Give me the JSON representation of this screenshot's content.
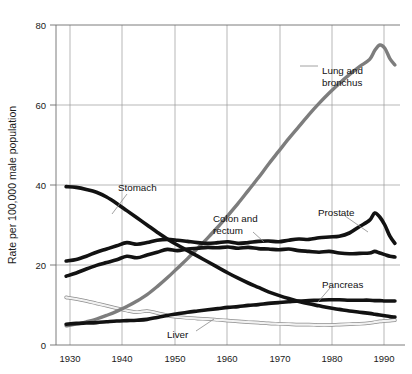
{
  "chart_data": {
    "type": "line",
    "title": "",
    "xlabel": "",
    "ylabel": "Rate per 100,000 male population",
    "xlim": [
      1928,
      1996
    ],
    "ylim": [
      0,
      80
    ],
    "xticks": [
      "1930",
      "1940",
      "1950",
      "1960",
      "1970",
      "1980",
      "1990"
    ],
    "xtick_values": [
      1930,
      1940,
      1950,
      1960,
      1970,
      1980,
      1990
    ],
    "yticks": [
      "0",
      "20",
      "40",
      "60",
      "80"
    ],
    "ytick_values": [
      0,
      20,
      40,
      60,
      80
    ],
    "grid": true,
    "legend_position": "inline-annotations",
    "x": [
      1930,
      1932,
      1934,
      1936,
      1938,
      1940,
      1942,
      1944,
      1946,
      1948,
      1950,
      1952,
      1954,
      1956,
      1958,
      1960,
      1962,
      1964,
      1966,
      1968,
      1970,
      1972,
      1974,
      1976,
      1978,
      1980,
      1982,
      1984,
      1986,
      1988,
      1990,
      1991,
      1992,
      1993,
      1994,
      1995
    ],
    "series": [
      {
        "name": "Lung and bronchus",
        "color": "#7d7d7d",
        "label": "Lung and bronchus",
        "values": [
          4.8,
          5.2,
          5.8,
          6.5,
          7.4,
          8.4,
          9.6,
          11.0,
          12.6,
          14.6,
          16.8,
          19.2,
          21.6,
          24.2,
          26.8,
          29.5,
          32.4,
          35.4,
          38.6,
          41.8,
          45.2,
          48.4,
          51.6,
          54.6,
          57.6,
          60.4,
          63.0,
          65.4,
          67.6,
          69.6,
          71.4,
          73.6,
          75.0,
          74.2,
          71.6,
          70.0
        ]
      },
      {
        "name": "Stomach",
        "color": "#121212",
        "label": "Stomach",
        "values": [
          39.6,
          39.4,
          38.9,
          38.2,
          37.0,
          35.4,
          33.6,
          31.8,
          30.0,
          28.2,
          26.5,
          25.0,
          23.6,
          22.2,
          20.8,
          19.4,
          18.0,
          16.7,
          15.5,
          14.4,
          13.3,
          12.4,
          11.6,
          10.9,
          10.3,
          9.8,
          9.3,
          8.9,
          8.5,
          8.2,
          7.9,
          7.7,
          7.5,
          7.3,
          7.1,
          7.0
        ]
      },
      {
        "name": "Prostate",
        "color": "#121212",
        "label": "Prostate",
        "values": [
          21.0,
          21.4,
          22.2,
          23.2,
          24.0,
          24.8,
          25.6,
          25.2,
          25.6,
          26.2,
          26.4,
          26.2,
          25.9,
          25.6,
          25.4,
          25.6,
          25.8,
          25.4,
          25.6,
          25.9,
          26.0,
          25.8,
          26.2,
          26.5,
          26.4,
          26.8,
          27.0,
          27.2,
          28.0,
          29.6,
          31.2,
          33.0,
          32.0,
          30.0,
          27.2,
          25.4
        ]
      },
      {
        "name": "Colon and rectum",
        "color": "#121212",
        "label": "Colon and rectum",
        "values": [
          17.2,
          18.0,
          19.0,
          19.9,
          20.6,
          21.3,
          22.2,
          21.8,
          22.5,
          23.2,
          23.9,
          23.6,
          24.0,
          24.2,
          24.4,
          24.3,
          24.5,
          24.2,
          24.4,
          24.1,
          24.0,
          23.8,
          24.0,
          23.6,
          23.4,
          23.2,
          23.4,
          23.0,
          22.8,
          22.9,
          23.0,
          23.4,
          23.0,
          22.6,
          22.2,
          22.0
        ]
      },
      {
        "name": "Pancreas",
        "color": "#121212",
        "label": "Pancreas",
        "values": [
          5.2,
          5.4,
          5.5,
          5.6,
          5.8,
          6.0,
          6.1,
          6.2,
          6.4,
          6.9,
          7.4,
          7.8,
          8.2,
          8.5,
          8.8,
          9.1,
          9.4,
          9.6,
          9.9,
          10.1,
          10.4,
          10.6,
          10.8,
          11.0,
          11.1,
          11.2,
          11.3,
          11.3,
          11.2,
          11.2,
          11.2,
          11.1,
          11.1,
          11.0,
          11.0,
          11.0
        ]
      },
      {
        "name": "Liver",
        "color": "#f2f2f2",
        "stroke_outline": "#8d8d8d",
        "label": "Liver",
        "values": [
          11.9,
          11.5,
          11.0,
          10.4,
          9.8,
          9.2,
          8.6,
          8.2,
          8.5,
          8.0,
          7.4,
          7.0,
          6.8,
          6.6,
          6.5,
          6.3,
          6.1,
          5.9,
          5.7,
          5.6,
          5.4,
          5.3,
          5.2,
          5.1,
          5.1,
          5.0,
          5.0,
          5.1,
          5.2,
          5.3,
          5.5,
          5.7,
          5.9,
          6.0,
          6.1,
          6.2
        ]
      }
    ],
    "annotations": [
      {
        "text": "Lung and bronchus",
        "lines": [
          "Lung and",
          "bronchus"
        ],
        "x": 322,
        "y": 70
      },
      {
        "text": "Stomach",
        "lines": [
          "Stomach"
        ],
        "x": 118,
        "y": 190
      },
      {
        "text": "Colon and rectum",
        "lines": [
          "Colon and",
          "rectum"
        ],
        "x": 213,
        "y": 218
      },
      {
        "text": "Prostate",
        "lines": [
          "Prostate"
        ],
        "x": 320,
        "y": 213
      },
      {
        "text": "Pancreas",
        "lines": [
          "Pancreas"
        ],
        "x": 322,
        "y": 284
      },
      {
        "text": "Liver",
        "lines": [
          "Liver"
        ],
        "x": 167,
        "y": 334
      }
    ]
  }
}
